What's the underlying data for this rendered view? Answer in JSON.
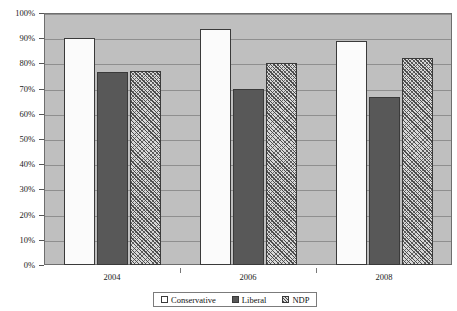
{
  "title_sliver": "",
  "chart_data": {
    "type": "bar",
    "title": "",
    "subtitle": "",
    "xlabel": "",
    "ylabel": "",
    "categories": [
      "2004",
      "2006",
      "2008"
    ],
    "series": [
      {
        "name": "Conservative",
        "values": [
          90,
          93.5,
          89
        ],
        "fill": "white",
        "color": "#fbfbfb"
      },
      {
        "name": "Liberal",
        "values": [
          76.5,
          70,
          66.5
        ],
        "fill": "solid",
        "color": "#585858"
      },
      {
        "name": "NDP",
        "values": [
          77,
          80,
          82
        ],
        "fill": "hatched",
        "color": "#d8d8d8"
      }
    ],
    "ylim": [
      0,
      100
    ],
    "ytick_values": [
      0,
      10,
      20,
      30,
      40,
      50,
      60,
      70,
      80,
      90,
      100
    ],
    "ytick_labels": [
      "0%",
      "10%",
      "20%",
      "30%",
      "40%",
      "50%",
      "60%",
      "70%",
      "80%",
      "90%",
      "100%"
    ],
    "grid": true,
    "grid_axis": "y",
    "legend_position": "bottom",
    "plot_background": "#bfbfbf",
    "page_background": "#ffffff"
  },
  "legend": {
    "items": [
      {
        "label": "Conservative",
        "swatch": "legend-swatch-conservative"
      },
      {
        "label": "Liberal",
        "swatch": "legend-swatch-liberal"
      },
      {
        "label": "NDP",
        "swatch": "legend-swatch-ndp"
      }
    ]
  }
}
